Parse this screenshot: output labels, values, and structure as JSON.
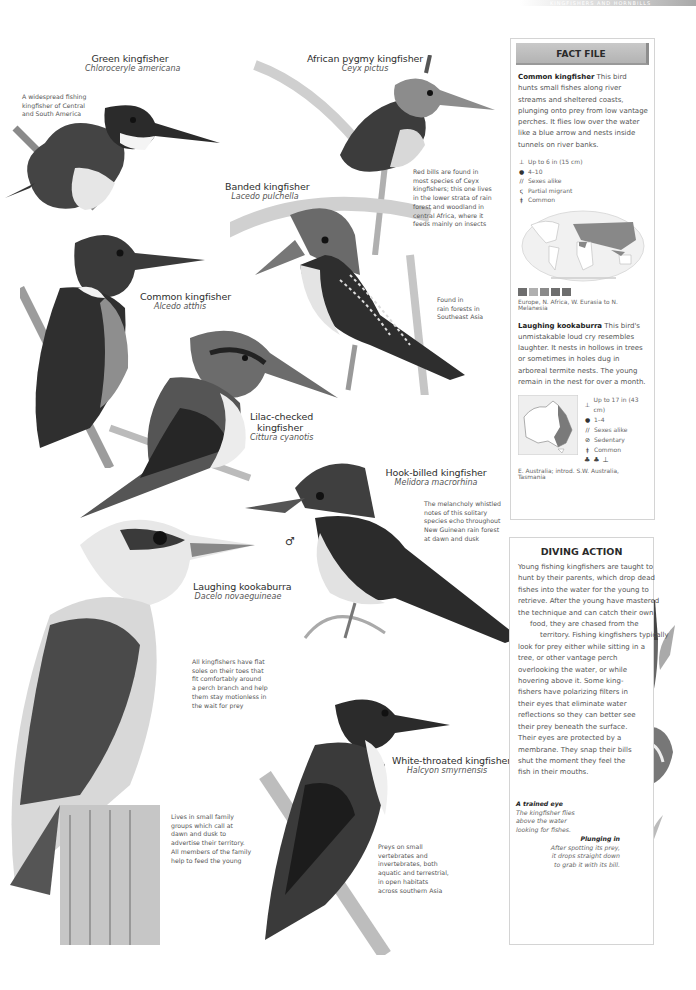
{
  "page": {
    "running_header": "KINGFISHERS AND HORNBILLS",
    "accent_colors": {
      "panel_title_bg": "#bdbdbd",
      "panel_border": "#d4d4d4",
      "text": "#555555"
    }
  },
  "species": [
    {
      "id": "green",
      "common": "Green kingfisher",
      "scientific": "Chloroceryle americana",
      "note": [
        "A widespread fishing",
        "kingfisher of Central",
        "and South America"
      ]
    },
    {
      "id": "african-pygmy",
      "common": "African pygmy kingfisher",
      "scientific": "Ceyx pictus",
      "note": [
        "Red bills are found in",
        "most species of Ceyx",
        "kingfishers; this one lives",
        "in the lower strata of rain",
        "forest and woodland in",
        "central Africa, where it",
        "feeds mainly on insects"
      ]
    },
    {
      "id": "banded",
      "common": "Banded kingfisher",
      "scientific": "Lacedo pulchella",
      "note": [
        "Found in",
        "rain forests in",
        "Southeast Asia"
      ]
    },
    {
      "id": "common",
      "common": "Common kingfisher",
      "scientific": "Alcedo atthis"
    },
    {
      "id": "lilac-cheeked",
      "common_line1": "Lilac-checked",
      "common_line2": "kingfisher",
      "scientific": "Cittura cyanotis"
    },
    {
      "id": "hook-billed",
      "common": "Hook-billed kingfisher",
      "scientific": "Melidora macrorhina",
      "note": [
        "The melancholy whistled",
        "notes of this solitary",
        "species echo throughout",
        "New Guinean rain forest",
        "at dawn and dusk"
      ],
      "sex_symbol": "♂"
    },
    {
      "id": "kookaburra",
      "common": "Laughing kookaburra",
      "scientific": "Dacelo novaeguineae",
      "note": [
        "All kingfishers have flat",
        "soles on their toes that",
        "fit comfortably around",
        "a perch branch and help",
        "them stay motionless in",
        "the wait for prey"
      ],
      "note2": [
        "Lives in small family",
        "groups which call at",
        "dawn and dusk to",
        "advertise their territory.",
        "All members of the family",
        "help to feed the young"
      ]
    },
    {
      "id": "white-throated",
      "common": "White-throated kingfisher",
      "scientific": "Halcyon smyrnensis",
      "note": [
        "Preys on small",
        "vertebrates and",
        "invertebrates, both",
        "aquatic and terrestrial,",
        "in open habitats",
        "across southern Asia"
      ]
    }
  ],
  "fact_file": {
    "title": "FACT FILE",
    "common_kingfisher": {
      "name": "Common kingfisher",
      "text": "This bird hunts small fishes along river streams and sheltered coasts, plunging onto prey from low vantage perches. It flies low over the water like a blue arrow and nests inside tunnels on river banks.",
      "stats": [
        {
          "icon": "size-icon",
          "glyph": "⊥",
          "text": "Up to 6 in (15 cm)"
        },
        {
          "icon": "egg-icon",
          "glyph": "●",
          "text": "4–10"
        },
        {
          "icon": "sexes-icon",
          "glyph": "//",
          "text": "Sexes alike"
        },
        {
          "icon": "migration-icon",
          "glyph": "ς",
          "text": "Partial migrant"
        },
        {
          "icon": "status-icon",
          "glyph": "ǂ",
          "text": "Common"
        }
      ],
      "range": "Europe, N. Africa, W. Eurasia to N. Melanesia"
    },
    "kookaburra": {
      "name": "Laughing kookaburra",
      "text": "This bird's unmistakable loud cry resembles laughter. It nests in hollows in trees or sometimes in holes dug in arboreal termite nests. The young remain in the nest for over a month.",
      "stats": [
        {
          "icon": "size-icon",
          "glyph": "⊥",
          "text": "Up to 17 in (43 cm)"
        },
        {
          "icon": "egg-icon",
          "glyph": "●",
          "text": "1–4"
        },
        {
          "icon": "sexes-icon",
          "glyph": "//",
          "text": "Sexes alike"
        },
        {
          "icon": "sedentary-icon",
          "glyph": "⊘",
          "text": "Sedentary"
        },
        {
          "icon": "status-icon",
          "glyph": "ǂ",
          "text": "Common"
        }
      ],
      "range": "E. Australia; introd. S.W. Australia, Tasmania"
    }
  },
  "diving_action": {
    "title": "DIVING ACTION",
    "lines": [
      "Young fishing kingfishers are taught to",
      "hunt by their parents, which drop dead",
      "fishes into the water for the young to",
      "retrieve. After the young have mastered",
      "the technique and can catch their own",
      "   food, they are chased from the",
      "      territory. Fishing kingfishers typically",
      "look for prey either while sitting in a",
      "tree, or other vantage perch",
      "overlooking the water, or while",
      "hovering above it. Some king-",
      "fishers have polarizing filters in",
      "their eyes that eliminate water",
      "reflections so they can better see",
      "their prey beneath the surface.",
      "Their eyes are protected by a",
      "membrane. They snap their bills",
      "shut the moment they feel the",
      "fish in their mouths."
    ],
    "caption1": {
      "title": "A trained eye",
      "lines": [
        "The kingfisher flies",
        "above the water",
        "looking for fishes."
      ]
    },
    "caption2": {
      "title": "Plunging in",
      "lines": [
        "After spotting its prey,",
        "it drops straight down",
        "to grab it with its bill."
      ]
    }
  }
}
